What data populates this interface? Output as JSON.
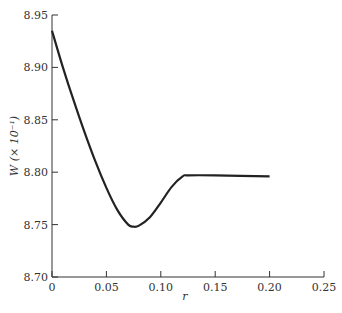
{
  "chart_data": {
    "type": "line",
    "title": "",
    "xlabel": "r",
    "ylabel": "W (× 10⁻¹)",
    "xlim": [
      0,
      0.25
    ],
    "ylim": [
      8.7,
      8.95
    ],
    "x_ticks": [
      "0",
      "0.05",
      "0.10",
      "0.15",
      "0.20",
      "0.25"
    ],
    "y_ticks": [
      "8.70",
      "8.75",
      "8.80",
      "8.85",
      "8.90",
      "8.95"
    ],
    "grid": false,
    "legend": null,
    "series": [
      {
        "name": "W",
        "x": [
          0,
          0.01,
          0.02,
          0.03,
          0.04,
          0.05,
          0.06,
          0.07,
          0.075,
          0.08,
          0.09,
          0.1,
          0.11,
          0.12,
          0.125,
          0.15,
          0.2
        ],
        "y": [
          8.935,
          8.9,
          8.868,
          8.838,
          8.81,
          8.785,
          8.764,
          8.75,
          8.748,
          8.749,
          8.757,
          8.771,
          8.786,
          8.796,
          8.797,
          8.797,
          8.796
        ]
      }
    ]
  },
  "labels": {
    "xlabel": "r",
    "ylabel": "W (× 10⁻¹)"
  }
}
